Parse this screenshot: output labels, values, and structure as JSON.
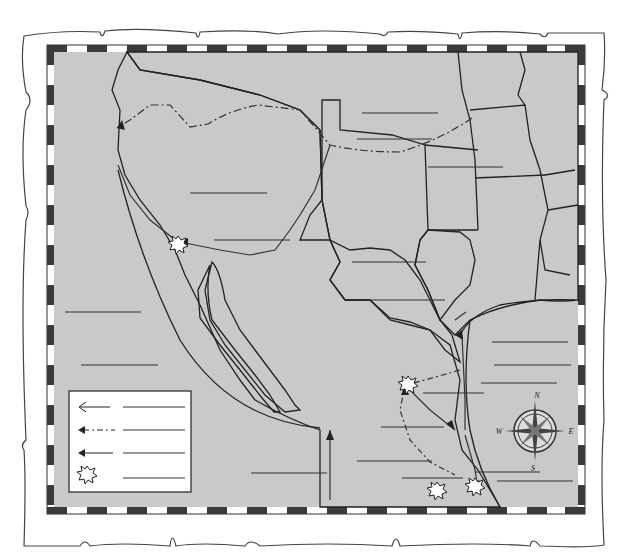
{
  "map": {
    "kind": "blank outline worksheet map",
    "colors": {
      "water": "#c9c9c9",
      "land": "#eeeeee",
      "us_states": "#cccccc",
      "shaded_territory": "#a8a8a8",
      "border_dark": "#3a3a3a",
      "border_light": "#ffffff",
      "parchment": "#ffffff"
    },
    "compass": {
      "north": "N",
      "south": "S",
      "east": "E",
      "west": "W"
    },
    "legend": {
      "entries": [
        {
          "symbol": "solid-open-arrow",
          "label": ""
        },
        {
          "symbol": "dash-dot-filled-arrow",
          "label": ""
        },
        {
          "symbol": "solid-filled-arrow",
          "label": ""
        },
        {
          "symbol": "battle-burst",
          "label": ""
        }
      ]
    },
    "blank_label_count": 24
  }
}
